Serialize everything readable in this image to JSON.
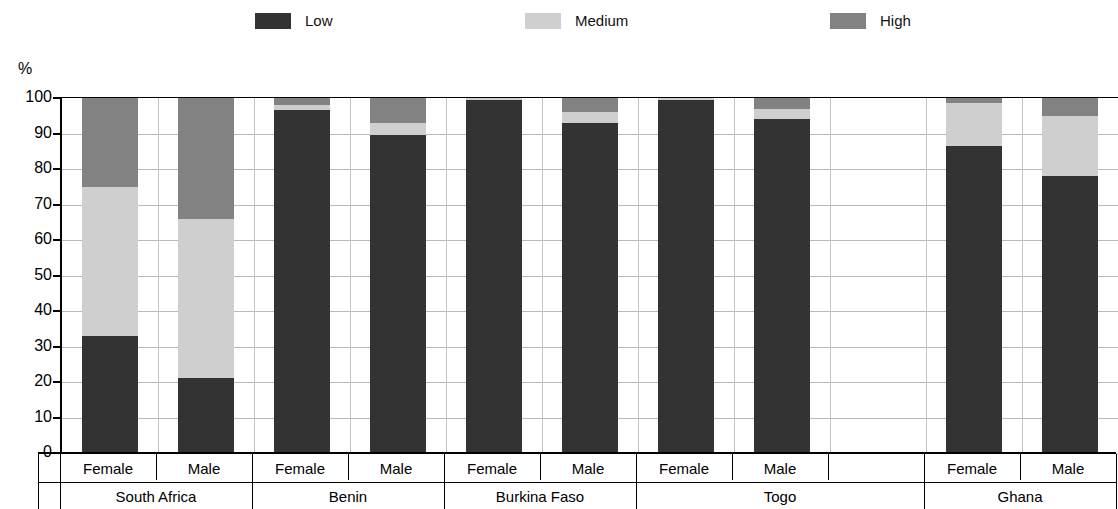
{
  "legend": {
    "items": [
      {
        "label": "Low",
        "color": "#333333",
        "icon": "legend-swatch-low"
      },
      {
        "label": "Medium",
        "color": "#cfcfcf",
        "icon": "legend-swatch-medium"
      },
      {
        "label": "High",
        "color": "#828282",
        "icon": "legend-swatch-high"
      }
    ]
  },
  "chart_data": {
    "type": "bar",
    "subtype": "stacked-100",
    "title": "",
    "xlabel": "",
    "ylabel": "%",
    "ylim": [
      0,
      100
    ],
    "yticks": [
      0,
      10,
      20,
      30,
      40,
      50,
      60,
      70,
      80,
      90,
      100
    ],
    "ytick_labels": [
      "0",
      "10",
      "20",
      "30",
      "40",
      "50",
      "60",
      "70",
      "80",
      "90",
      "100"
    ],
    "grid": true,
    "legend_position": "top",
    "groups": [
      "South Africa",
      "Benin",
      "Burkina Faso",
      "Togo",
      "Ghana"
    ],
    "categories": [
      "South Africa Female",
      "South Africa Male",
      "Benin Female",
      "Benin Male",
      "Burkina Faso Female",
      "Burkina Faso Male",
      "Togo Female",
      "Togo Male",
      "Ghana Female",
      "Ghana Male"
    ],
    "series": [
      {
        "name": "Low",
        "color": "#333333",
        "values": [
          33,
          21,
          96.5,
          89.5,
          99.5,
          93,
          99.5,
          94,
          86.5,
          78
        ]
      },
      {
        "name": "Medium",
        "color": "#cfcfcf",
        "values": [
          42,
          45,
          1.5,
          3.5,
          0.5,
          3,
          0.5,
          3,
          12,
          17
        ]
      },
      {
        "name": "High",
        "color": "#828282",
        "values": [
          25,
          34,
          2,
          7,
          0,
          4,
          0,
          3,
          1.5,
          5
        ]
      }
    ]
  },
  "axis": {
    "unit": "%",
    "columns": [
      {
        "group": "South Africa",
        "gender": "Female",
        "slot": 0
      },
      {
        "group": "South Africa",
        "gender": "Male",
        "slot": 1
      },
      {
        "group": "Benin",
        "gender": "Female",
        "slot": 2
      },
      {
        "group": "Benin",
        "gender": "Male",
        "slot": 3
      },
      {
        "group": "Burkina Faso",
        "gender": "Female",
        "slot": 4
      },
      {
        "group": "Burkina Faso",
        "gender": "Male",
        "slot": 5
      },
      {
        "group": "Togo",
        "gender": "Female",
        "slot": 6
      },
      {
        "group": "Togo",
        "gender": "Male",
        "slot": 7
      },
      {
        "group": "",
        "gender": "",
        "slot": 8
      },
      {
        "group": "Ghana",
        "gender": "Female",
        "slot": 9
      },
      {
        "group": "Ghana",
        "gender": "Male",
        "slot": 10
      }
    ],
    "group_spans": [
      {
        "label": "South Africa",
        "start": 0,
        "end": 1
      },
      {
        "label": "Benin",
        "start": 2,
        "end": 3
      },
      {
        "label": "Burkina Faso",
        "start": 4,
        "end": 5
      },
      {
        "label": "Togo",
        "start": 6,
        "end": 8
      },
      {
        "label": "Ghana",
        "start": 9,
        "end": 10
      }
    ]
  }
}
